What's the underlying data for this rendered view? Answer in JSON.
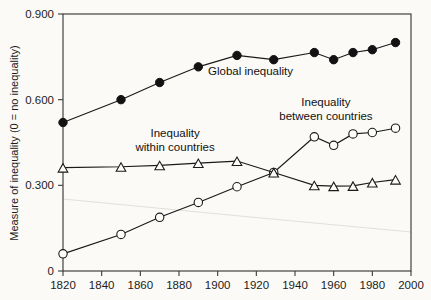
{
  "figure": {
    "background_color": "#fbfaf7",
    "ink_color": "#1a1a1a",
    "y_axis_title": "Measure of inequality (0 = no inequality)",
    "x_axis_title": ""
  },
  "axes": {
    "y_ticks": [
      "0",
      "0.300",
      "0.600",
      "0.900"
    ],
    "y_tick_values": [
      0,
      0.3,
      0.6,
      0.9
    ],
    "x_ticks": [
      "1820",
      "1840",
      "1860",
      "1880",
      "1900",
      "1920",
      "1940",
      "1960",
      "1980",
      "2000"
    ],
    "x_tick_values": [
      1820,
      1840,
      1860,
      1880,
      1900,
      1920,
      1940,
      1960,
      1980,
      2000
    ]
  },
  "annotations": [
    {
      "name": "global-inequality",
      "lines": [
        "Global inequality"
      ],
      "x": 1917,
      "y": 0.688
    },
    {
      "name": "inequality-within-countries",
      "lines": [
        "Inequality",
        "within countries"
      ],
      "x": 1878,
      "y": 0.468
    },
    {
      "name": "inequality-between-countries",
      "lines": [
        "Inequality",
        "between countries"
      ],
      "x": 1956,
      "y": 0.578
    }
  ],
  "chart_data": {
    "type": "line",
    "title": "",
    "subtitle": "",
    "xlabel": "",
    "ylabel": "Measure of inequality (0 = no inequality)",
    "xlim": [
      1820,
      2000
    ],
    "ylim": [
      0,
      0.9
    ],
    "grid": false,
    "legend_position": "inline-annotations",
    "x_tick_labels": [
      "1820",
      "1840",
      "1860",
      "1880",
      "1900",
      "1920",
      "1940",
      "1960",
      "1980",
      "2000"
    ],
    "y_tick_labels": [
      "0",
      "0.300",
      "0.600",
      "0.900"
    ],
    "series": [
      {
        "name": "Global inequality",
        "marker": "filled-circle",
        "x": [
          1820,
          1850,
          1870,
          1890,
          1910,
          1929,
          1950,
          1960,
          1970,
          1980,
          1992
        ],
        "values": [
          0.52,
          0.6,
          0.66,
          0.715,
          0.755,
          0.74,
          0.765,
          0.74,
          0.765,
          0.775,
          0.8
        ]
      },
      {
        "name": "Inequality between countries",
        "marker": "open-circle",
        "x": [
          1820,
          1850,
          1870,
          1890,
          1910,
          1929,
          1950,
          1960,
          1970,
          1980,
          1992
        ],
        "values": [
          0.06,
          0.128,
          0.188,
          0.24,
          0.295,
          0.345,
          0.47,
          0.44,
          0.48,
          0.485,
          0.5
        ]
      },
      {
        "name": "Inequality within countries",
        "marker": "open-triangle",
        "x": [
          1820,
          1850,
          1870,
          1890,
          1910,
          1929,
          1950,
          1960,
          1970,
          1980,
          1992
        ],
        "values": [
          0.362,
          0.365,
          0.37,
          0.378,
          0.385,
          0.345,
          0.3,
          0.297,
          0.298,
          0.31,
          0.32
        ]
      }
    ]
  }
}
